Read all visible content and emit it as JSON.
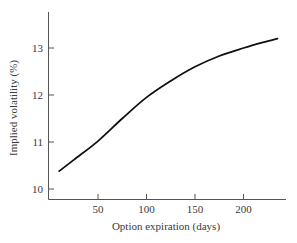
{
  "chart_data": {
    "type": "line",
    "title": "",
    "xlabel": "Option expiration (days)",
    "ylabel": "Implied volatility (%)",
    "xlim": [
      0,
      245
    ],
    "ylim": [
      9.8,
      13.8
    ],
    "x_ticks": [
      50,
      100,
      150,
      200
    ],
    "y_ticks": [
      10,
      11,
      12,
      13
    ],
    "grid": false,
    "legend": null,
    "series": [
      {
        "name": "Implied volatility",
        "x": [
          10,
          25,
          50,
          75,
          100,
          125,
          150,
          175,
          200,
          220,
          235
        ],
        "y": [
          10.38,
          10.62,
          11.02,
          11.5,
          11.95,
          12.3,
          12.6,
          12.83,
          13.0,
          13.12,
          13.2
        ]
      }
    ]
  },
  "axes": {
    "x_title": "Option expiration (days)",
    "y_title": "Implied volatility (%)",
    "x_tick_labels": [
      "50",
      "100",
      "150",
      "200"
    ],
    "y_tick_labels": [
      "10",
      "11",
      "12",
      "13"
    ]
  }
}
